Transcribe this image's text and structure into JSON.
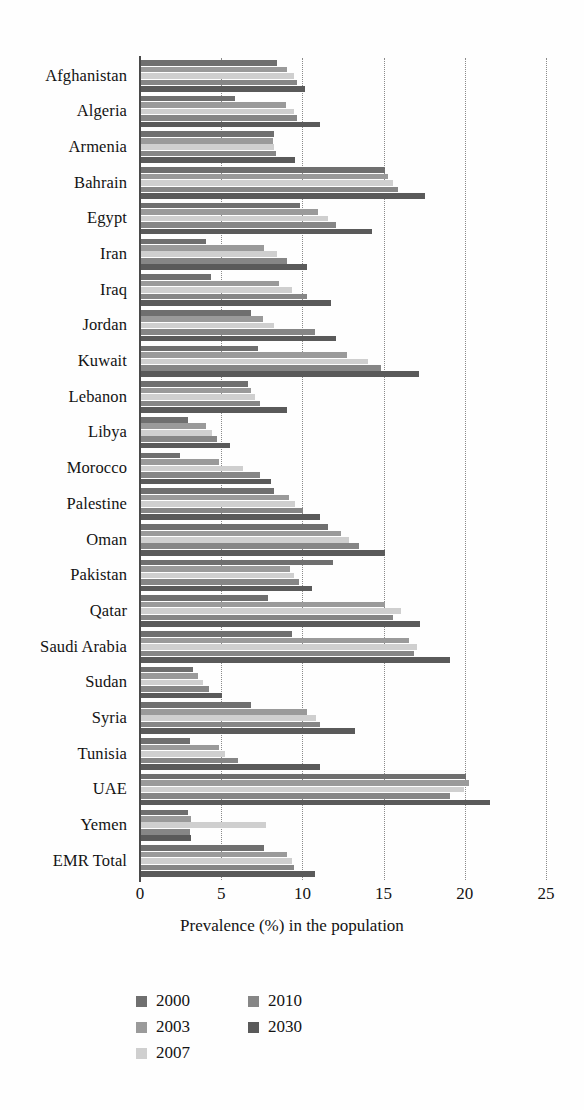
{
  "chart_data": {
    "type": "bar",
    "orientation": "horizontal",
    "title": "",
    "subtitle": "",
    "xlabel": "Prevalence (%) in the population",
    "ylabel": "",
    "xlim": [
      0,
      25
    ],
    "xticks": [
      0,
      5,
      10,
      15,
      20,
      25
    ],
    "grid": "vertical dotted gridlines at each x tick",
    "legend_position": "bottom-center",
    "categories": [
      "Afghanistan",
      "Algeria",
      "Armenia",
      "Bahrain",
      "Egypt",
      "Iran",
      "Iraq",
      "Jordan",
      "Kuwait",
      "Lebanon",
      "Libya",
      "Morocco",
      "Palestine",
      "Oman",
      "Pakistan",
      "Qatar",
      "Saudi Arabia",
      "Sudan",
      "Syria",
      "Tunisia",
      "UAE",
      "Yemen",
      "EMR Total"
    ],
    "series": [
      {
        "name": "2000",
        "color": "#6f6f6f",
        "values": [
          8.4,
          5.8,
          8.2,
          15.0,
          9.8,
          4.0,
          4.3,
          6.8,
          7.2,
          6.6,
          2.9,
          2.4,
          8.2,
          11.5,
          11.8,
          7.8,
          9.3,
          3.2,
          6.8,
          3.0,
          20.0,
          2.9,
          7.6
        ]
      },
      {
        "name": "2003",
        "color": "#9a9a9a",
        "values": [
          9.0,
          8.9,
          8.1,
          15.2,
          10.9,
          7.6,
          8.5,
          7.5,
          12.7,
          6.8,
          4.0,
          4.8,
          9.1,
          12.3,
          9.2,
          15.0,
          16.5,
          3.5,
          10.2,
          4.8,
          20.2,
          3.1,
          9.0
        ]
      },
      {
        "name": "2007",
        "color": "#cfcfcf",
        "values": [
          9.4,
          9.4,
          8.2,
          15.5,
          11.5,
          8.4,
          9.3,
          8.2,
          14.0,
          7.0,
          4.4,
          6.3,
          9.5,
          12.8,
          9.4,
          16.0,
          17.0,
          3.8,
          10.8,
          5.2,
          19.9,
          7.7,
          9.3
        ]
      },
      {
        "name": "2010",
        "color": "#868686",
        "values": [
          9.6,
          9.6,
          8.3,
          15.8,
          12.0,
          9.0,
          10.2,
          10.7,
          14.8,
          7.3,
          4.7,
          7.3,
          10.0,
          13.4,
          9.7,
          15.5,
          16.8,
          4.2,
          11.0,
          6.0,
          19.0,
          3.0,
          9.4
        ]
      },
      {
        "name": "2030",
        "color": "#5a5a5a",
        "values": [
          10.1,
          11.0,
          9.5,
          17.5,
          14.2,
          10.2,
          11.7,
          12.0,
          17.1,
          9.0,
          5.5,
          8.0,
          11.0,
          15.0,
          10.5,
          17.2,
          19.0,
          5.0,
          13.2,
          11.0,
          21.5,
          3.1,
          10.7
        ]
      }
    ],
    "legend": [
      {
        "label": "2000",
        "color": "#6f6f6f"
      },
      {
        "label": "2010",
        "color": "#868686"
      },
      {
        "label": "2003",
        "color": "#9a9a9a"
      },
      {
        "label": "2030",
        "color": "#5a5a5a"
      },
      {
        "label": "2007",
        "color": "#cfcfcf"
      }
    ],
    "axis_color": "#4a4a4a",
    "gridline_color": "#8a8a8a"
  }
}
